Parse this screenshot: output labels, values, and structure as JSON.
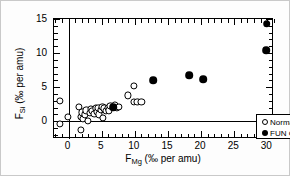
{
  "chart_data": {
    "type": "scatter",
    "title": "",
    "xlabel": "F_Mg (‰ per amu)",
    "ylabel": "F_Si (‰ per amu)",
    "xlabel_parts": {
      "base": "F",
      "sub": "Mg",
      "units": " (‰ per amu)"
    },
    "ylabel_parts": {
      "base": "F",
      "sub": "Si",
      "units": " (‰ per amu)"
    },
    "xlim": [
      -2.2,
      31.0
    ],
    "ylim": [
      -2.6,
      15.0
    ],
    "xticks": [
      0,
      5,
      10,
      15,
      20,
      25,
      30
    ],
    "xtick_labels": [
      "0",
      "5",
      "10",
      "15",
      "20",
      "25",
      "30"
    ],
    "yticks": [
      0,
      5,
      10,
      15
    ],
    "ytick_labels": [
      "0",
      "5",
      "10",
      "15"
    ],
    "x_minor_step": 1,
    "y_minor_step": 1,
    "grid": false,
    "zero_lines": true,
    "legend_position": "lower-right-inside",
    "series": [
      {
        "name": "Normal CAIs",
        "marker": "open-circle",
        "color": "#000000",
        "fill": "#ffffff",
        "points": [
          [
            -1.3,
            3.0
          ],
          [
            -1.3,
            -0.4
          ],
          [
            -0.1,
            0.7
          ],
          [
            1.5,
            2.1
          ],
          [
            1.8,
            -1.3
          ],
          [
            1.9,
            0.6
          ],
          [
            2.1,
            1.3
          ],
          [
            2.2,
            0.3
          ],
          [
            2.5,
            1.0
          ],
          [
            2.7,
            1.6
          ],
          [
            2.9,
            0.0
          ],
          [
            3.2,
            1.2
          ],
          [
            3.4,
            1.8
          ],
          [
            3.6,
            1.5
          ],
          [
            3.9,
            1.1
          ],
          [
            4.1,
            1.9
          ],
          [
            4.3,
            1.4
          ],
          [
            4.5,
            2.0
          ],
          [
            4.6,
            1.0
          ],
          [
            4.9,
            1.7
          ],
          [
            5.1,
            2.1
          ],
          [
            5.2,
            0.5
          ],
          [
            5.4,
            1.9
          ],
          [
            5.6,
            1.5
          ],
          [
            5.9,
            2.0
          ],
          [
            6.1,
            1.6
          ],
          [
            6.3,
            2.2
          ],
          [
            7.0,
            2.4
          ],
          [
            7.3,
            2.0
          ],
          [
            7.6,
            2.1
          ],
          [
            8.9,
            3.8
          ],
          [
            9.8,
            5.2
          ],
          [
            9.9,
            2.9
          ],
          [
            10.4,
            2.8
          ],
          [
            11.0,
            2.8
          ]
        ]
      },
      {
        "name": "FUN CAIs",
        "marker": "filled-circle",
        "color": "#000000",
        "fill": "#000000",
        "points": [
          [
            6.7,
            2.1
          ],
          [
            12.8,
            6.0
          ],
          [
            18.2,
            6.8
          ],
          [
            20.3,
            6.2
          ],
          [
            29.9,
            14.3
          ],
          [
            29.8,
            10.4
          ]
        ]
      }
    ]
  },
  "legend": {
    "entries": [
      {
        "label": "Normal CAIs",
        "marker": "open-circle"
      },
      {
        "label": "FUN CAIs",
        "marker": "filled-circle"
      }
    ]
  }
}
